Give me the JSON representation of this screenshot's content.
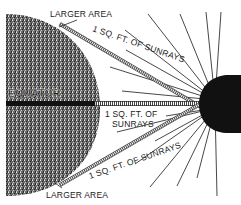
{
  "diagram": {
    "labels": {
      "equator": "EQUATOR",
      "larger_area_top": "LARGER AREA",
      "larger_area_bottom": "LARGER AREA",
      "sunrays_top": "1 SQ. FT. OF SUNRAYS",
      "sunrays_middle_line1": "1 SQ. FT. OF",
      "sunrays_middle_line2": "SUNRAYS",
      "sunrays_bottom": "1 SQ. FT. OF SUNRAYS"
    },
    "elements": {
      "earth": "stippled half-disc (left)",
      "sun": "black half-disc (right)",
      "rays": "radiating lines from sun",
      "beams": "three hatched beams (top, middle, bottom)"
    },
    "colors": {
      "earth_fill": "#4a4a4a",
      "sun_fill": "#111111",
      "ray_color": "#333333",
      "background": "#ffffff"
    }
  }
}
